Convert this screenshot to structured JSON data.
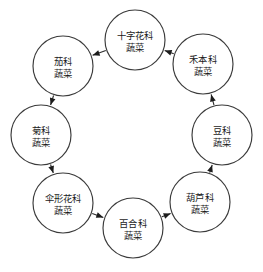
{
  "diagram": {
    "type": "cycle",
    "title": "",
    "background_color": "#ffffff",
    "node_fill_color": "#ffffff",
    "node_stroke_color": "#3a3a3a",
    "edge_color": "#2b2b2b",
    "text_color": "#1a1a1a",
    "direction": "counter-clockwise",
    "node_count": 8,
    "nodes": [
      {
        "id": "cruciferae",
        "line1": "十字花科",
        "line2": "蔬菜",
        "cx": 135,
        "cy": 40,
        "r": 30,
        "two_line": true
      },
      {
        "id": "gramineae",
        "line1": "禾本科",
        "line2": "蔬菜",
        "cx": 203,
        "cy": 64,
        "r": 30,
        "two_line": true
      },
      {
        "id": "leguminosae",
        "line1": "豆科",
        "line2": "蔬菜",
        "cx": 222,
        "cy": 135,
        "r": 30,
        "two_line": true
      },
      {
        "id": "cucurbitaceae",
        "line1": "葫芦科",
        "line2": "蔬菜",
        "cx": 200,
        "cy": 202,
        "r": 30,
        "two_line": true
      },
      {
        "id": "liliaceae",
        "line1": "百合科",
        "line2": "蔬菜",
        "cx": 133,
        "cy": 228,
        "r": 30,
        "two_line": true
      },
      {
        "id": "umbelliferae",
        "line1": "伞形花科",
        "line2": "蔬菜",
        "cx": 63,
        "cy": 203,
        "r": 30,
        "two_line": true
      },
      {
        "id": "compositae",
        "line1": "菊科",
        "line2": "蔬菜",
        "cx": 41,
        "cy": 135,
        "r": 30,
        "two_line": true
      },
      {
        "id": "solanaceae",
        "line1": "茄科",
        "line2": "蔬菜",
        "cx": 63,
        "cy": 66,
        "r": 30,
        "two_line": true
      }
    ],
    "edges": [
      {
        "id": "edge-1",
        "from": "cruciferae",
        "to": "solanaceae"
      },
      {
        "id": "edge-2",
        "from": "solanaceae",
        "to": "compositae"
      },
      {
        "id": "edge-3",
        "from": "compositae",
        "to": "umbelliferae"
      },
      {
        "id": "edge-4",
        "from": "umbelliferae",
        "to": "liliaceae"
      },
      {
        "id": "edge-5",
        "from": "liliaceae",
        "to": "cucurbitaceae"
      },
      {
        "id": "edge-6",
        "from": "cucurbitaceae",
        "to": "leguminosae"
      },
      {
        "id": "edge-7",
        "from": "leguminosae",
        "to": "gramineae"
      },
      {
        "id": "edge-8",
        "from": "gramineae",
        "to": "cruciferae"
      }
    ]
  }
}
